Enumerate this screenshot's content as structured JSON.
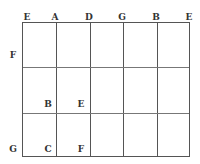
{
  "diagram": {
    "type": "grid",
    "columns": 5,
    "rows": 3,
    "top_labels": [
      "E",
      "A",
      "D",
      "G",
      "B",
      "E"
    ],
    "left_labels": {
      "row1": "F",
      "row3": "G"
    },
    "inner_labels": [
      {
        "text": "B",
        "row": 2,
        "col": 1
      },
      {
        "text": "E",
        "row": 2,
        "col": 2
      },
      {
        "text": "C",
        "row": 3,
        "col": 1
      },
      {
        "text": "F",
        "row": 3,
        "col": 2
      }
    ]
  }
}
